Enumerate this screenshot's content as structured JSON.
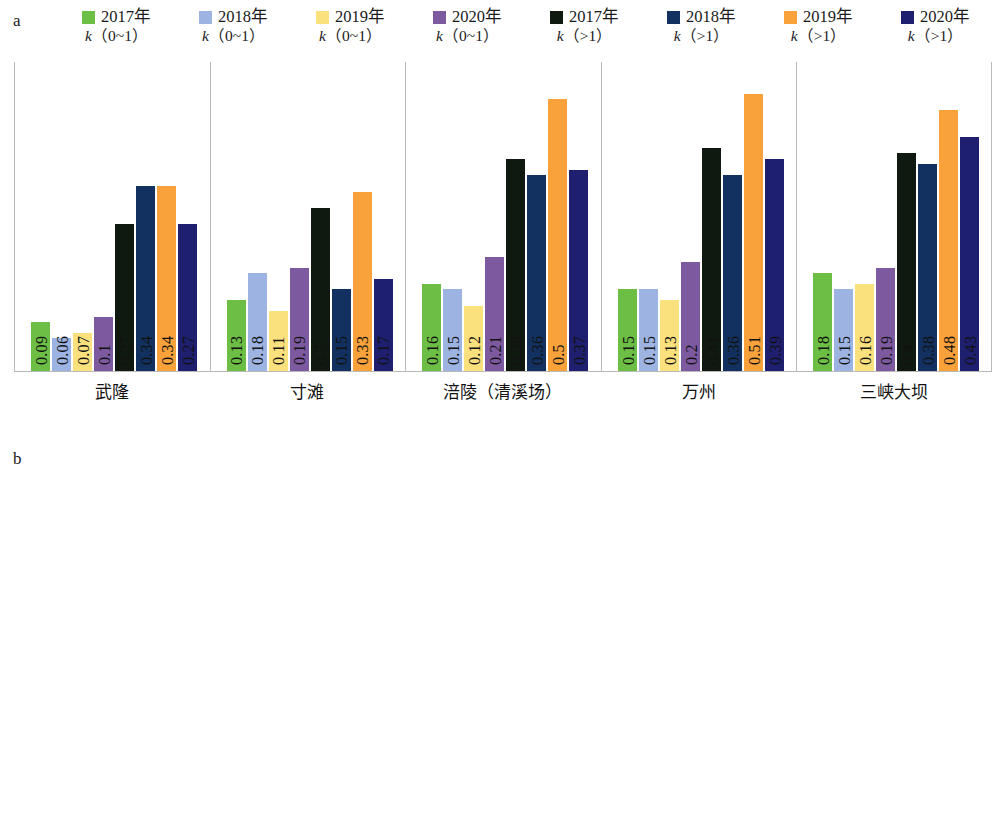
{
  "figure": {
    "panels": [
      {
        "letter": "a",
        "legend": [
          {
            "label": "2017年",
            "sub_k": "k",
            "sub_range": "（0~1）",
            "color": "#6cbe45"
          },
          {
            "label": "2018年",
            "sub_k": "k",
            "sub_range": "（0~1）",
            "color": "#9db4e3"
          },
          {
            "label": "2019年",
            "sub_k": "k",
            "sub_range": "（0~1）",
            "color": "#fbe07e"
          },
          {
            "label": "2020年",
            "sub_k": "k",
            "sub_range": "（0~1）",
            "color": "#7d5aa0"
          },
          {
            "label": "2017年",
            "sub_k": "k",
            "sub_range": "（>1）",
            "color": "#10190f"
          },
          {
            "label": "2018年",
            "sub_k": "k",
            "sub_range": "（>1）",
            "color": "#123160"
          },
          {
            "label": "2019年",
            "sub_k": "k",
            "sub_range": "（>1）",
            "color": "#f9a13a"
          },
          {
            "label": "2020年",
            "sub_k": "k",
            "sub_range": "（>1）",
            "color": "#1f1f70"
          }
        ]
      },
      {
        "letter": "b",
        "legend": [
          {
            "label": "2017年",
            "color": "#46a037"
          },
          {
            "label": "2018年",
            "color": "#1c5aa8"
          },
          {
            "label": "2019年",
            "color": "#fcb731"
          },
          {
            "label": "2020年",
            "color": "#20206a"
          }
        ]
      }
    ]
  },
  "chart_data": [
    {
      "type": "bar",
      "panel": "a",
      "title": "",
      "xlabel": "",
      "ylabel": "",
      "ylim": [
        0,
        0.57
      ],
      "grid": false,
      "legend_position": "top",
      "categories": [
        "武隆",
        "寸滩",
        "涪陵（清溪场）",
        "万州",
        "三峡大坝"
      ],
      "series": [
        {
          "name": "2017年 k（0~1）",
          "color": "#6cbe45",
          "values": [
            0.09,
            0.13,
            0.16,
            0.15,
            0.18
          ]
        },
        {
          "name": "2018年 k（0~1）",
          "color": "#9db4e3",
          "values": [
            0.06,
            0.18,
            0.15,
            0.15,
            0.15
          ]
        },
        {
          "name": "2019年 k（0~1）",
          "color": "#fbe07e",
          "values": [
            0.07,
            0.11,
            0.12,
            0.13,
            0.16
          ]
        },
        {
          "name": "2020年 k（0~1）",
          "color": "#7d5aa0",
          "values": [
            0.1,
            0.19,
            0.21,
            0.2,
            0.19
          ]
        },
        {
          "name": "2017年 k（>1）",
          "color": "#10190f",
          "values": [
            0.27,
            0.3,
            0.39,
            0.41,
            0.4
          ]
        },
        {
          "name": "2018年 k（>1）",
          "color": "#123160",
          "values": [
            0.34,
            0.15,
            0.36,
            0.36,
            0.38
          ]
        },
        {
          "name": "2019年 k（>1）",
          "color": "#f9a13a",
          "values": [
            0.34,
            0.33,
            0.5,
            0.51,
            0.48
          ]
        },
        {
          "name": "2020年 k（>1）",
          "color": "#1f1f70",
          "values": [
            0.27,
            0.17,
            0.37,
            0.39,
            0.43
          ]
        }
      ]
    },
    {
      "type": "bar",
      "panel": "b",
      "title": "",
      "xlabel": "",
      "ylabel": "",
      "ylim": [
        0,
        0.7
      ],
      "grid": false,
      "legend_position": "top",
      "categories": [
        "武隆",
        "寸滩",
        "涪陵（清溪场）",
        "万州",
        "三峡大坝"
      ],
      "series": [
        {
          "name": "2017年",
          "color": "#46a037",
          "values": [
            0.36,
            0.43,
            0.55,
            0.57,
            0.58
          ]
        },
        {
          "name": "2018年",
          "color": "#1c5aa8",
          "values": [
            0.4,
            0.33,
            0.51,
            0.51,
            0.53
          ]
        },
        {
          "name": "2019年",
          "color": "#fcb731",
          "values": [
            0.41,
            0.45,
            0.62,
            0.64,
            0.48
          ]
        },
        {
          "name": "2020年",
          "color": "#20206a",
          "values": [
            0.37,
            0.36,
            0.58,
            0.59,
            0.62
          ]
        }
      ]
    }
  ]
}
